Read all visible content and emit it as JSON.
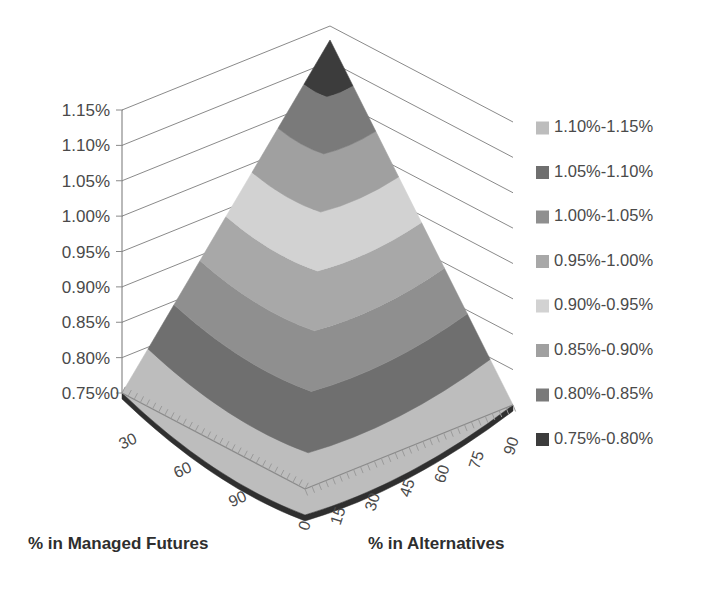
{
  "chart_data": {
    "type": "surface",
    "title": "",
    "xlabel": "% in Alternatives",
    "ylabel": "% in Managed Futures",
    "zlabel": "",
    "grid": true,
    "legend_position": "right",
    "x_ticks": [
      "0",
      "15",
      "30",
      "45",
      "60",
      "75",
      "90"
    ],
    "y_ticks": [
      "30",
      "60",
      "90"
    ],
    "z_ticks": [
      "0.75%",
      "0.80%",
      "0.85%",
      "0.90%",
      "0.95%",
      "1.00%",
      "1.05%",
      "1.10%",
      "1.15%"
    ],
    "zlim": [
      0.75,
      1.15
    ],
    "xlim": [
      0,
      90
    ],
    "ylim": [
      0,
      90
    ],
    "y_origin_tick": "0",
    "bands": [
      {
        "range": "1.10%-1.15%",
        "lo": 1.1,
        "hi": 1.15,
        "color": "#bdbdbd"
      },
      {
        "range": "1.05%-1.10%",
        "lo": 1.05,
        "hi": 1.1,
        "color": "#6f6f6f"
      },
      {
        "range": "1.00%-1.05%",
        "lo": 1.0,
        "hi": 1.05,
        "color": "#8f8f8f"
      },
      {
        "range": "0.95%-1.00%",
        "lo": 0.95,
        "hi": 1.0,
        "color": "#a8a8a8"
      },
      {
        "range": "0.90%-0.95%",
        "lo": 0.9,
        "hi": 0.95,
        "color": "#d2d2d2"
      },
      {
        "range": "0.85%-0.90%",
        "lo": 0.85,
        "hi": 0.9,
        "color": "#a0a0a0"
      },
      {
        "range": "0.80%-0.85%",
        "lo": 0.8,
        "hi": 0.85,
        "color": "#7a7a7a"
      },
      {
        "range": "0.75%-0.80%",
        "lo": 0.75,
        "hi": 0.8,
        "color": "#3c3c3c"
      }
    ]
  },
  "legend": {
    "items": [
      {
        "label": "1.10%-1.15%",
        "color": "#bdbdbd"
      },
      {
        "label": "1.05%-1.10%",
        "color": "#6f6f6f"
      },
      {
        "label": "1.00%-1.05%",
        "color": "#8f8f8f"
      },
      {
        "label": "0.95%-1.00%",
        "color": "#a8a8a8"
      },
      {
        "label": "0.90%-0.95%",
        "color": "#d2d2d2"
      },
      {
        "label": "0.85%-0.90%",
        "color": "#a0a0a0"
      },
      {
        "label": "0.80%-0.85%",
        "color": "#7a7a7a"
      },
      {
        "label": "0.75%-0.80%",
        "color": "#3c3c3c"
      }
    ]
  },
  "axes": {
    "z_labels": [
      "1.15%",
      "1.10%",
      "1.05%",
      "1.00%",
      "0.95%",
      "0.90%",
      "0.85%",
      "0.80%",
      "0.75%"
    ],
    "y_labels": [
      "30",
      "60",
      "90"
    ],
    "y_zero": "0",
    "x_labels": [
      "0",
      "15",
      "30",
      "45",
      "60",
      "75",
      "90"
    ],
    "left_title": "% in Managed Futures",
    "right_title": "% in Alternatives"
  }
}
